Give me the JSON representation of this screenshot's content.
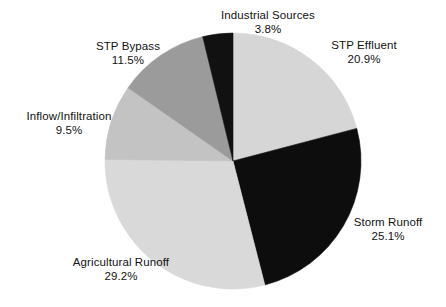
{
  "figure": {
    "background_color": "#ffffff",
    "text_color": "#121212"
  },
  "chart_data": {
    "type": "pie",
    "title": "",
    "subtitle": "",
    "xlabel": "",
    "ylabel": "",
    "legend_position": "none",
    "labels_position": "outside-callout-free",
    "units": "percent",
    "start_angle_deg": 0,
    "direction": "clockwise",
    "center": {
      "x": 233,
      "y": 161
    },
    "radius": 128,
    "total": 100.0,
    "categories": [
      "STP Effluent",
      "Storm Runoff",
      "Agricultural Runoff",
      "Inflow/Infiltration",
      "STP Bypass",
      "Industrial Sources"
    ],
    "values": [
      20.9,
      25.1,
      29.2,
      9.5,
      11.5,
      3.8
    ],
    "value_labels": [
      "20.9%",
      "25.1%",
      "29.2%",
      "9.5%",
      "11.5%",
      "3.8%"
    ],
    "colors": [
      "#d6d6d6",
      "#0d0d0d",
      "#d9d9d9",
      "#c3c3c3",
      "#9b9b9b",
      "#111111"
    ],
    "slices": [
      {
        "name": "STP Effluent",
        "value": 20.9,
        "value_label": "20.9%",
        "color": "#d6d6d6",
        "start_angle": 0.0,
        "end_angle": 75.24
      },
      {
        "name": "Storm Runoff",
        "value": 25.1,
        "value_label": "25.1%",
        "color": "#0d0d0d",
        "start_angle": 75.24,
        "end_angle": 165.6
      },
      {
        "name": "Agricultural Runoff",
        "value": 29.2,
        "value_label": "29.2%",
        "color": "#d9d9d9",
        "start_angle": 165.6,
        "end_angle": 270.72
      },
      {
        "name": "Inflow/Infiltration",
        "value": 9.5,
        "value_label": "9.5%",
        "color": "#c3c3c3",
        "start_angle": 270.72,
        "end_angle": 304.92
      },
      {
        "name": "STP Bypass",
        "value": 11.5,
        "value_label": "11.5%",
        "color": "#9b9b9b",
        "start_angle": 304.92,
        "end_angle": 346.32
      },
      {
        "name": "Industrial Sources",
        "value": 3.8,
        "value_label": "3.8%",
        "color": "#111111",
        "start_angle": 346.32,
        "end_angle": 360.0
      }
    ]
  },
  "labels": {
    "industrial_sources": {
      "name": "Industrial Sources",
      "value": "3.8%"
    },
    "stp_effluent": {
      "name": "STP Effluent",
      "value": "20.9%"
    },
    "storm_runoff": {
      "name": "Storm Runoff",
      "value": "25.1%"
    },
    "agricultural_runoff": {
      "name": "Agricultural Runoff",
      "value": "29.2%"
    },
    "inflow_infiltration": {
      "name": "Inflow/Infiltration",
      "value": "9.5%"
    },
    "stp_bypass": {
      "name": "STP Bypass",
      "value": "11.5%"
    }
  }
}
